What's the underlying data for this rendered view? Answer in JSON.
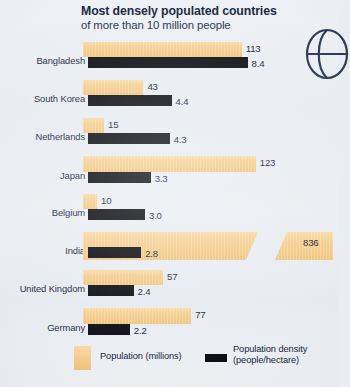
{
  "chart_data": {
    "type": "bar",
    "title": "Most densely populated countries",
    "subtitle": "of more than 10 million people",
    "orientation": "horizontal",
    "grid": false,
    "legend_position": "bottom",
    "categories": [
      "Bangladesh",
      "South Korea",
      "Netherlands",
      "Japan",
      "Belgium",
      "India",
      "United Kingdom",
      "Germany"
    ],
    "series": [
      {
        "name": "Population (millions)",
        "unit": "millions",
        "color": "#f2c983",
        "values": [
          113,
          43,
          15,
          123,
          10,
          836,
          57,
          77
        ],
        "value_labels": [
          "113",
          "43",
          "15",
          "123",
          "10",
          "836",
          "57",
          "77"
        ],
        "broken_axis_category": "India",
        "broken_axis_note": "India bar is drawn with a diagonal axis break"
      },
      {
        "name": "Population density (people/hectare)",
        "unit": "people/hectare",
        "color": "#0d0f14",
        "values": [
          8.4,
          4.4,
          4.3,
          3.3,
          3.0,
          2.8,
          2.4,
          2.2
        ],
        "value_labels": [
          "8.4",
          "4.4",
          "4.3",
          "3.3",
          "3.0",
          "2.8",
          "2.4",
          "2.2"
        ]
      }
    ],
    "xlabel": "",
    "ylabel": "",
    "sorted_by": "Population density (people/hectare), descending"
  },
  "legend": {
    "population_label": "Population (millions)",
    "density_label_line1": "Population density",
    "density_label_line2": "(people/hectare)"
  }
}
